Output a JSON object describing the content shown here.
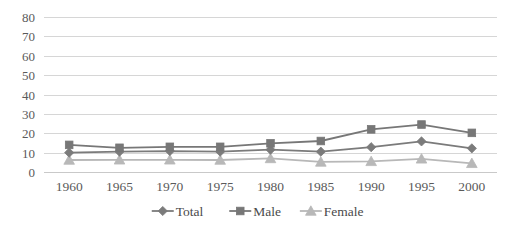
{
  "chart_data": {
    "type": "line",
    "title": "",
    "subtitle": "",
    "xlabel": "",
    "ylabel": "",
    "categories": [
      "1960",
      "1965",
      "1970",
      "1975",
      "1980",
      "1985",
      "1990",
      "1995",
      "2000"
    ],
    "series": [
      {
        "name": "Total",
        "marker": "diamond",
        "color": "#7b7b7b",
        "values": [
          10.0,
          10.5,
          10.8,
          10.5,
          11.5,
          10.5,
          12.8,
          15.8,
          12.2
        ]
      },
      {
        "name": "Male",
        "marker": "square",
        "color": "#777777",
        "values": [
          14.0,
          12.5,
          13.0,
          13.0,
          14.8,
          16.0,
          22.0,
          24.5,
          20.2
        ]
      },
      {
        "name": "Female",
        "marker": "triangle",
        "color": "#b8b8b8",
        "values": [
          6.2,
          6.3,
          6.3,
          6.2,
          7.0,
          5.2,
          5.5,
          6.8,
          4.5
        ]
      }
    ],
    "ylim": [
      0,
      80
    ],
    "yticks": [
      0,
      10,
      20,
      30,
      40,
      50,
      60,
      70,
      80
    ],
    "ytick_labels": [
      "0",
      "10",
      "20",
      "30",
      "40",
      "50",
      "60",
      "70",
      "80"
    ],
    "grid": true,
    "grid_axis": "y",
    "legend": {
      "position": "bottom",
      "entries": [
        {
          "label": "Total",
          "marker": "diamond",
          "color": "#7b7b7b"
        },
        {
          "label": "Male",
          "marker": "square",
          "color": "#777777"
        },
        {
          "label": "Female",
          "marker": "triangle",
          "color": "#b8b8b8"
        }
      ]
    },
    "colors": {
      "total": "#7b7b7b",
      "male": "#777777",
      "female": "#b8b8b8",
      "gridline": "#d6d6d6",
      "text": "#5a5a5a",
      "background": "#ffffff"
    }
  }
}
